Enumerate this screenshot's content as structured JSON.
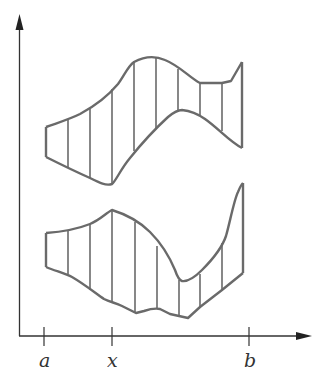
{
  "diagram": {
    "axis_labels": {
      "a": "a",
      "x": "x",
      "b": "b"
    },
    "colors": {
      "stroke": "#6a6a6a",
      "axis": "#333333",
      "background": "#ffffff"
    },
    "upper_region": {
      "slice_x": [
        46,
        68,
        90,
        112,
        134,
        156,
        178,
        200,
        222,
        242
      ],
      "top_y": [
        127,
        119,
        108,
        88,
        62,
        58,
        70,
        83,
        83,
        62
      ],
      "bottom_y": [
        157,
        167,
        178,
        183,
        150,
        128,
        110,
        115,
        130,
        148
      ]
    },
    "lower_region": {
      "slice_x": [
        46,
        68,
        90,
        112,
        135,
        157,
        179,
        200,
        223,
        243
      ],
      "top_y": [
        233,
        231,
        224,
        210,
        224,
        247,
        280,
        273,
        240,
        183
      ],
      "bottom_y": [
        267,
        273,
        290,
        302,
        313,
        308,
        317,
        307,
        290,
        273
      ]
    }
  }
}
